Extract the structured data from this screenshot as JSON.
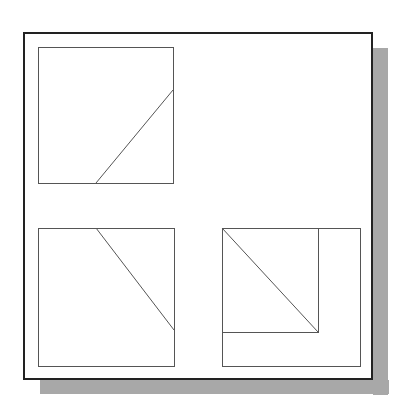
{
  "figure": {
    "width": 406,
    "height": 412,
    "background": "#ffffff",
    "frame": {
      "x": 24,
      "y": 33,
      "w": 348,
      "h": 346,
      "stroke": "#222222",
      "stroke_width": 2
    },
    "shadow": {
      "offset_x": 16,
      "offset_y": 15,
      "color": "#a8a8a8"
    },
    "panels": [
      {
        "name": "panel-top-left",
        "square": {
          "x": 38,
          "y": 47,
          "w": 135,
          "h": 136
        },
        "lines": [
          {
            "x1": 173,
            "y1": 90,
            "x2": 96,
            "y2": 183
          }
        ]
      },
      {
        "name": "panel-bottom-left",
        "square": {
          "x": 38,
          "y": 228,
          "w": 136,
          "h": 138
        },
        "lines": [
          {
            "x1": 96,
            "y1": 228,
            "x2": 174,
            "y2": 330
          }
        ]
      },
      {
        "name": "panel-bottom-right",
        "square": {
          "x": 222,
          "y": 228,
          "w": 138,
          "h": 138
        },
        "inner_square": {
          "x": 222,
          "y": 228,
          "w": 96,
          "h": 104
        },
        "lines": [
          {
            "x1": 222,
            "y1": 228,
            "x2": 318,
            "y2": 332
          }
        ]
      }
    ],
    "line_color": "#555555",
    "line_width": 1
  }
}
